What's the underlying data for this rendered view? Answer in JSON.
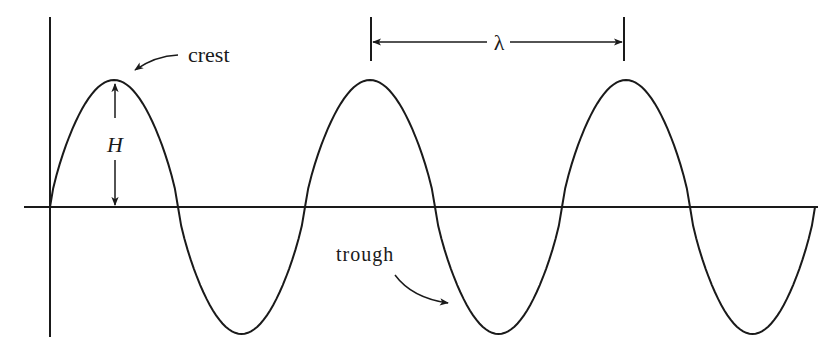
{
  "diagram": {
    "type": "wave-anatomy",
    "colors": {
      "background": "#ffffff",
      "ink": "#1a1a1a"
    },
    "labels": {
      "crest": "crest",
      "trough": "trough",
      "height": "H",
      "wavelength": "λ"
    },
    "wave": {
      "axis_y": 207,
      "amplitude": 127,
      "zero_crossings_x": [
        50,
        178,
        305,
        435,
        562,
        690,
        815
      ],
      "crests_x": [
        114,
        371,
        625
      ],
      "troughs_x": [
        242,
        497,
        753
      ]
    },
    "axes": {
      "vertical": {
        "x": 50,
        "y1": 17,
        "y2": 337
      },
      "horizontal": {
        "y": 207,
        "x1": 24,
        "x2": 818
      }
    },
    "wavelength_marker": {
      "x1": 370,
      "x2": 625,
      "y": 42
    },
    "height_marker": {
      "x": 115,
      "y_top": 80,
      "y_bottom": 207
    }
  }
}
